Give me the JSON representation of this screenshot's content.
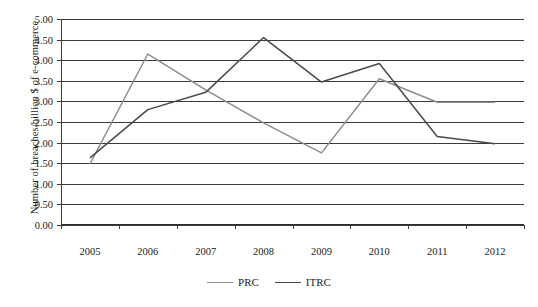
{
  "chart_data": {
    "type": "line",
    "title": "",
    "xlabel": "",
    "ylabel": "Number of breaches/billion $ of e-commerce",
    "categories": [
      "2005",
      "2006",
      "2007",
      "2008",
      "2009",
      "2010",
      "2011",
      "2012"
    ],
    "ylim": [
      0.0,
      5.0
    ],
    "ytick_step": 0.5,
    "ytick_labels": [
      "0.00",
      "0.50",
      "1.00",
      "1.50",
      "2.00",
      "2.50",
      "3.00",
      "3.50",
      "4.00",
      "4.50",
      "5.00"
    ],
    "grid": true,
    "legend_position": "bottom-center",
    "series": [
      {
        "name": "PRC",
        "color": "#8d8d8d",
        "values": [
          1.48,
          4.15,
          3.28,
          2.48,
          1.75,
          3.55,
          2.98,
          2.98
        ]
      },
      {
        "name": "ITRC",
        "color": "#4a4a4a",
        "values": [
          1.63,
          2.8,
          3.22,
          4.55,
          3.47,
          3.92,
          2.15,
          1.97
        ]
      }
    ]
  },
  "axes": {
    "y_title": "Number of breaches/billion $ of e-commerce"
  },
  "legend": {
    "items": [
      {
        "label": "PRC",
        "color": "#8d8d8d"
      },
      {
        "label": "ITRC",
        "color": "#4a4a4a"
      }
    ]
  }
}
